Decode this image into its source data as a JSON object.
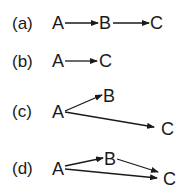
{
  "panels": [
    {
      "label": "(a)",
      "nodes": {
        "A": "A",
        "B": "B",
        "C": "C"
      },
      "edges": [
        "A→B",
        "B→C"
      ]
    },
    {
      "label": "(b)",
      "nodes": {
        "A": "A",
        "C": "C"
      },
      "edges": [
        "A→C"
      ]
    },
    {
      "label": "(c)",
      "nodes": {
        "A": "A",
        "B": "B",
        "C": "C"
      },
      "edges": [
        "A→B",
        "A→C"
      ]
    },
    {
      "label": "(d)",
      "nodes": {
        "A": "A",
        "B": "B",
        "C": "C"
      },
      "edges": [
        "A→B",
        "B→C",
        "A→C"
      ]
    }
  ],
  "colors": {
    "ink": "#1a1a1a",
    "background": "#ffffff"
  }
}
